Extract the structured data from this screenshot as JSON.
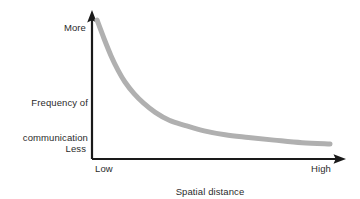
{
  "figure": {
    "background_color": "#ffffff",
    "axis_color": "#1a1a1a",
    "curve_color": "#b0b0b0",
    "text_color": "#2b2b2b"
  },
  "axes": {
    "y": {
      "label_line1": "Frequency of",
      "label_line2": "communication",
      "tick_high": "More",
      "tick_low": "Less"
    },
    "x": {
      "label_line1": "Spatial distance",
      "label_line2": "of separation",
      "tick_low": "Low",
      "tick_high": "High"
    }
  },
  "chart_data": {
    "type": "line",
    "title": "",
    "xlabel": "Spatial distance of separation",
    "ylabel": "Frequency of communication",
    "grid": false,
    "legend": false,
    "xticklabels": [
      "Low",
      "High"
    ],
    "yticklabels": [
      "Less",
      "More"
    ],
    "xlim": [
      0,
      1
    ],
    "ylim": [
      0,
      1
    ],
    "annotation": "Frequency of communication decays sharply as spatial distance of separation increases (Allen curve).",
    "series": [
      {
        "name": "Frequency of communication vs. distance",
        "color": "#b0b0b0",
        "linewidth": 5,
        "x": [
          0.0,
          0.03,
          0.06,
          0.09,
          0.12,
          0.16,
          0.2,
          0.25,
          0.31,
          0.38,
          0.46,
          0.55,
          0.65,
          0.76,
          0.88,
          1.0
        ],
        "y": [
          1.0,
          0.86,
          0.73,
          0.62,
          0.53,
          0.44,
          0.37,
          0.3,
          0.24,
          0.2,
          0.16,
          0.13,
          0.11,
          0.09,
          0.07,
          0.06
        ]
      }
    ]
  }
}
